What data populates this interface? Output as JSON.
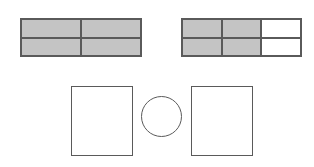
{
  "diagram": {
    "colors": {
      "shaded": "#c4c4c4",
      "unshaded": "#ffffff",
      "stroke": "#5a5a5a"
    },
    "left_grid": {
      "rows": 2,
      "cols": 2,
      "cells": [
        [
          "shaded",
          "shaded"
        ],
        [
          "shaded",
          "shaded"
        ]
      ],
      "x": 20,
      "y": 18,
      "width": 122,
      "height": 39
    },
    "right_grid": {
      "rows": 2,
      "cols": 3,
      "cells": [
        [
          "shaded",
          "shaded",
          "unshaded"
        ],
        [
          "shaded",
          "shaded",
          "unshaded"
        ]
      ],
      "x": 181,
      "y": 18,
      "width": 121,
      "height": 39
    },
    "bottom_shapes": [
      {
        "type": "rectangle",
        "x": 71,
        "y": 86,
        "width": 62,
        "height": 70
      },
      {
        "type": "circle",
        "x": 141,
        "y": 96,
        "width": 41,
        "height": 41
      },
      {
        "type": "rectangle",
        "x": 191,
        "y": 86,
        "width": 62,
        "height": 70
      }
    ]
  }
}
